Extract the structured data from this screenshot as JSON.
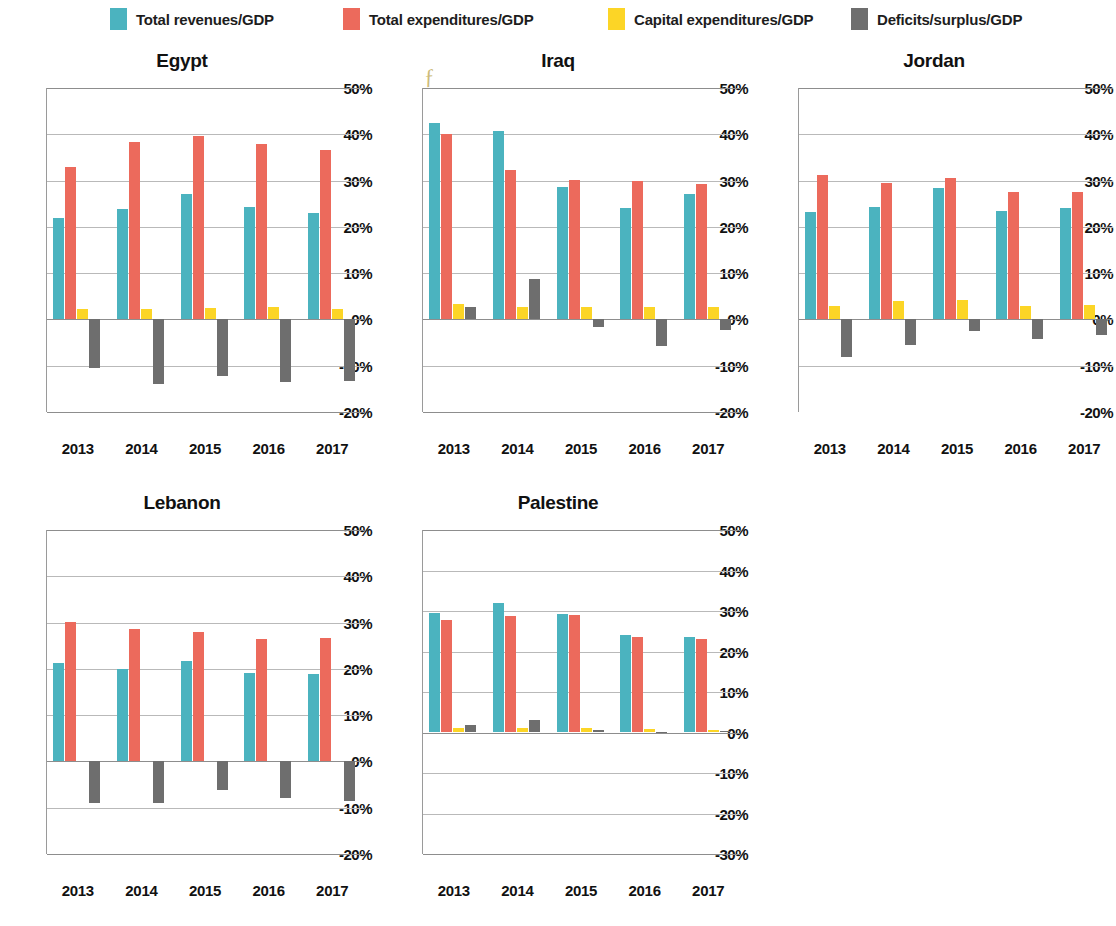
{
  "legend": {
    "items": [
      {
        "label": "Total revenues/GDP",
        "color": "#4bb3bf",
        "x": 110
      },
      {
        "label": "Total expenditures/GDP",
        "color": "#ec6a5c",
        "x": 343
      },
      {
        "label": "Capital expenditures/GDP",
        "color": "#fcd526",
        "x": 608
      },
      {
        "label": "Deficits/surplus/GDP",
        "color": "#6e6e6e",
        "x": 851
      }
    ]
  },
  "chart_data": [
    {
      "type": "bar",
      "title": "Egypt",
      "xlabel": "",
      "ylabel": "",
      "ylim": [
        -20,
        50
      ],
      "yticks": [
        "50%",
        "40%",
        "30%",
        "20%",
        "10%",
        "0%",
        "-10%",
        "-20%"
      ],
      "ytick_values": [
        50,
        40,
        30,
        20,
        10,
        0,
        -10,
        -20
      ],
      "grid": true,
      "legend_position": "top",
      "categories": [
        "2013",
        "2014",
        "2015",
        "2016",
        "2017"
      ],
      "series": [
        {
          "name": "Total revenues/GDP",
          "color": "#4bb3bf",
          "values": [
            22.0,
            23.8,
            27.0,
            24.3,
            23.0
          ]
        },
        {
          "name": "Total expenditures/GDP",
          "color": "#ec6a5c",
          "values": [
            33.0,
            38.3,
            39.6,
            38.0,
            36.6
          ]
        },
        {
          "name": "Capital expenditures/GDP",
          "color": "#fcd526",
          "values": [
            2.2,
            2.2,
            2.4,
            2.6,
            2.2
          ]
        },
        {
          "name": "Deficits/surplus/GDP",
          "color": "#6e6e6e",
          "values": [
            -10.5,
            -14.0,
            -12.3,
            -13.5,
            -13.3
          ]
        }
      ]
    },
    {
      "type": "bar",
      "title": "Iraq",
      "xlabel": "",
      "ylabel": "",
      "ylim": [
        -20,
        50
      ],
      "yticks": [
        "50%",
        "40%",
        "30%",
        "20%",
        "10%",
        "0%",
        "-10%",
        "-20%"
      ],
      "ytick_values": [
        50,
        40,
        30,
        20,
        10,
        0,
        -10,
        -20
      ],
      "grid": true,
      "legend_position": "top",
      "categories": [
        "2013",
        "2014",
        "2015",
        "2016",
        "2017"
      ],
      "series": [
        {
          "name": "Total revenues/GDP",
          "color": "#4bb3bf",
          "values": [
            42.5,
            40.8,
            28.7,
            24.0,
            27.0
          ]
        },
        {
          "name": "Total expenditures/GDP",
          "color": "#ec6a5c",
          "values": [
            40.0,
            32.3,
            30.2,
            30.0,
            29.2
          ]
        },
        {
          "name": "Capital expenditures/GDP",
          "color": "#fcd526",
          "values": [
            3.3,
            2.7,
            2.7,
            2.7,
            2.7
          ]
        },
        {
          "name": "Deficits/surplus/GDP",
          "color": "#6e6e6e",
          "values": [
            2.6,
            8.7,
            -1.6,
            -5.8,
            -2.2
          ]
        }
      ]
    },
    {
      "type": "bar",
      "title": "Jordan",
      "xlabel": "",
      "ylabel": "",
      "ylim": [
        -20,
        50
      ],
      "yticks": [
        "50%",
        "40%",
        "30%",
        "20%",
        "10%",
        "0%",
        "-10%",
        "-20%"
      ],
      "ytick_values": [
        50,
        40,
        30,
        20,
        10,
        0,
        -10,
        -20
      ],
      "grid": true,
      "legend_position": "top",
      "categories": [
        "2013",
        "2014",
        "2015",
        "2016",
        "2017"
      ],
      "series": [
        {
          "name": "Total revenues/GDP",
          "color": "#4bb3bf",
          "values": [
            23.3,
            24.2,
            28.4,
            23.5,
            24.1
          ]
        },
        {
          "name": "Total expenditures/GDP",
          "color": "#ec6a5c",
          "values": [
            31.2,
            29.5,
            30.6,
            27.5,
            27.5
          ]
        },
        {
          "name": "Capital expenditures/GDP",
          "color": "#fcd526",
          "values": [
            2.8,
            4.0,
            4.2,
            2.8,
            3.2
          ]
        },
        {
          "name": "Deficits/surplus/GDP",
          "color": "#6e6e6e",
          "values": [
            -8.2,
            -5.5,
            -2.5,
            -4.2,
            -3.4
          ]
        }
      ]
    },
    {
      "type": "bar",
      "title": "Lebanon",
      "xlabel": "",
      "ylabel": "",
      "ylim": [
        -20,
        50
      ],
      "yticks": [
        "50%",
        "40%",
        "30%",
        "20%",
        "10%",
        "0%",
        "-10%",
        "-20%"
      ],
      "ytick_values": [
        50,
        40,
        30,
        20,
        10,
        0,
        -10,
        -20
      ],
      "grid": true,
      "legend_position": "top",
      "categories": [
        "2013",
        "2014",
        "2015",
        "2016",
        "2017"
      ],
      "series": [
        {
          "name": "Total revenues/GDP",
          "color": "#4bb3bf",
          "values": [
            21.2,
            20.0,
            21.8,
            19.0,
            18.8
          ]
        },
        {
          "name": "Total expenditures/GDP",
          "color": "#ec6a5c",
          "values": [
            30.2,
            28.6,
            27.9,
            26.5,
            26.6
          ]
        },
        {
          "name": "Capital expenditures/GDP",
          "color": "#fcd526",
          "values": [
            0,
            0,
            0,
            0,
            0
          ]
        },
        {
          "name": "Deficits/surplus/GDP",
          "color": "#6e6e6e",
          "values": [
            -9.0,
            -9.0,
            -6.2,
            -7.8,
            -8.6
          ]
        }
      ]
    },
    {
      "type": "bar",
      "title": "Palestine",
      "xlabel": "",
      "ylabel": "",
      "ylim": [
        -30,
        50
      ],
      "yticks": [
        "50%",
        "40%",
        "30%",
        "20%",
        "10%",
        "0%",
        "-10%",
        "-20%",
        "-30%"
      ],
      "ytick_values": [
        50,
        40,
        30,
        20,
        10,
        0,
        -10,
        -20,
        -30
      ],
      "grid": true,
      "legend_position": "top",
      "categories": [
        "2013",
        "2014",
        "2015",
        "2016",
        "2017"
      ],
      "series": [
        {
          "name": "Total revenues/GDP",
          "color": "#4bb3bf",
          "values": [
            29.5,
            32.0,
            29.3,
            24.0,
            23.6
          ]
        },
        {
          "name": "Total expenditures/GDP",
          "color": "#ec6a5c",
          "values": [
            27.9,
            28.7,
            28.9,
            23.7,
            23.0
          ]
        },
        {
          "name": "Capital expenditures/GDP",
          "color": "#fcd526",
          "values": [
            1.1,
            1.2,
            1.1,
            0.8,
            0.7
          ]
        },
        {
          "name": "Deficits/surplus/GDP",
          "color": "#6e6e6e",
          "values": [
            1.9,
            3.2,
            0.5,
            0.2,
            0.4
          ]
        }
      ]
    }
  ],
  "layout": {
    "panels": [
      {
        "key": "egypt",
        "left": 0,
        "top": 50,
        "width": 372,
        "plot_left": 46,
        "plot_top": 38,
        "plot_width": 318,
        "plot_height": 324,
        "clip_right": false
      },
      {
        "key": "iraq",
        "left": 376,
        "top": 50,
        "width": 372,
        "plot_left": 46,
        "plot_top": 38,
        "plot_width": 318,
        "plot_height": 324,
        "clip_right": false
      },
      {
        "key": "jordan",
        "left": 752,
        "top": 50,
        "width": 361,
        "plot_left": 46,
        "plot_top": 38,
        "plot_width": 318,
        "plot_height": 324,
        "clip_right": true
      },
      {
        "key": "lebanon",
        "left": 0,
        "top": 492,
        "width": 372,
        "plot_left": 46,
        "plot_top": 38,
        "plot_width": 318,
        "plot_height": 324,
        "clip_right": false
      },
      {
        "key": "palestine",
        "left": 376,
        "top": 492,
        "width": 372,
        "plot_left": 46,
        "plot_top": 38,
        "plot_width": 318,
        "plot_height": 324,
        "clip_right": false
      }
    ]
  },
  "annotation": {
    "pen_mark": "ƒ"
  }
}
